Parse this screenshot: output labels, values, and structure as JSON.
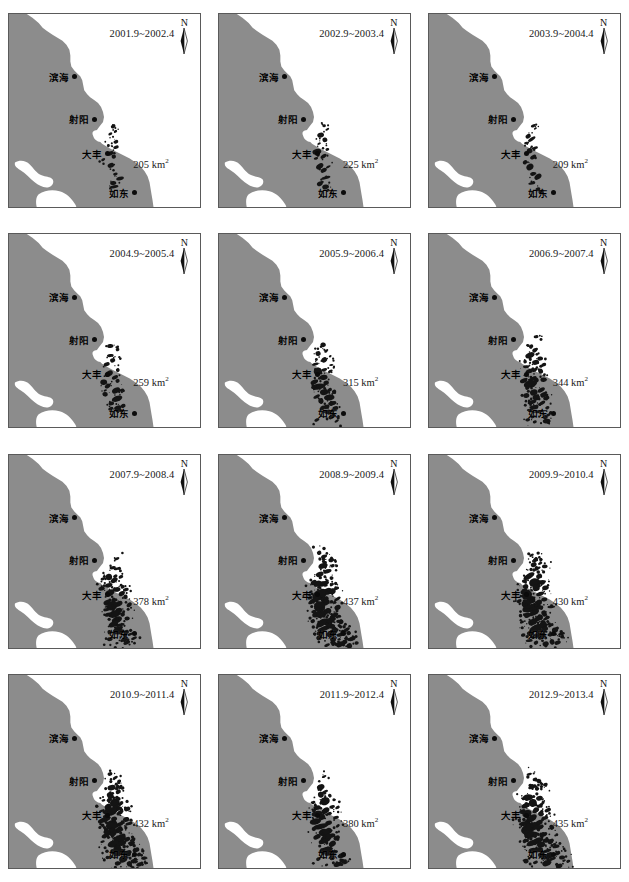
{
  "figure": {
    "unit_label": "km",
    "unit_exponent": "2",
    "north_letter": "N",
    "land_color": "#8c8c8c",
    "sea_color": "#ffffff",
    "patch_color": "#141414",
    "frame_color": "#5a5a5a",
    "cities": [
      {
        "name": "滨海",
        "x": 21,
        "y": 29
      },
      {
        "name": "射阳",
        "x": 31,
        "y": 51
      },
      {
        "name": "大丰",
        "x": 38,
        "y": 69
      },
      {
        "name": "如东",
        "x": 52,
        "y": 89
      }
    ]
  },
  "chart_data": {
    "type": "table",
    "xlabel": "Observation period",
    "ylabel": "Area (km2)",
    "categories": [
      "2001.9~2002.4",
      "2002.9~2003.4",
      "2003.9~2004.4",
      "2004.9~2005.4",
      "2005.9~2006.4",
      "2006.9~2007.4",
      "2007.9~2008.4",
      "2008.9~2009.4",
      "2009.9~2010.4",
      "2010.9~2011.4",
      "2011.9~2012.4",
      "2012.9~2013.4"
    ],
    "values": [
      205,
      225,
      209,
      259,
      315,
      344,
      378,
      437,
      430,
      432,
      380,
      435
    ],
    "ylim": [
      0,
      500
    ],
    "grid": false,
    "legend": "none"
  },
  "panels": [
    {
      "id": "p1",
      "period": "2001.9~2002.4",
      "area": "205",
      "area_x": 124,
      "area_y": 143,
      "density": 0.18
    },
    {
      "id": "p2",
      "period": "2002.9~2003.4",
      "area": "225",
      "area_x": 124,
      "area_y": 143,
      "density": 0.22
    },
    {
      "id": "p3",
      "period": "2003.9~2004.4",
      "area": "209",
      "area_x": 124,
      "area_y": 143,
      "density": 0.2
    },
    {
      "id": "p4",
      "period": "2004.9~2005.4",
      "area": "259",
      "area_x": 124,
      "area_y": 141,
      "density": 0.3
    },
    {
      "id": "p5",
      "period": "2005.9~2006.4",
      "area": "315",
      "area_x": 124,
      "area_y": 141,
      "density": 0.42
    },
    {
      "id": "p6",
      "period": "2006.9~2007.4",
      "area": "344",
      "area_x": 124,
      "area_y": 141,
      "density": 0.5
    },
    {
      "id": "p7",
      "period": "2007.9~2008.4",
      "area": "378",
      "area_x": 124,
      "area_y": 139,
      "density": 0.58
    },
    {
      "id": "p8",
      "period": "2008.9~2009.4",
      "area": "437",
      "area_x": 124,
      "area_y": 139,
      "density": 0.78
    },
    {
      "id": "p9",
      "period": "2009.9~2010.4",
      "area": "430",
      "area_x": 124,
      "area_y": 139,
      "density": 0.74
    },
    {
      "id": "p10",
      "period": "2010.9~2011.4",
      "area": "432",
      "area_x": 124,
      "area_y": 141,
      "density": 0.76
    },
    {
      "id": "p11",
      "period": "2011.9~2012.4",
      "area": "380",
      "area_x": 124,
      "area_y": 141,
      "density": 0.6
    },
    {
      "id": "p12",
      "period": "2012.9~2013.4",
      "area": "435",
      "area_x": 124,
      "area_y": 141,
      "density": 0.77
    }
  ]
}
